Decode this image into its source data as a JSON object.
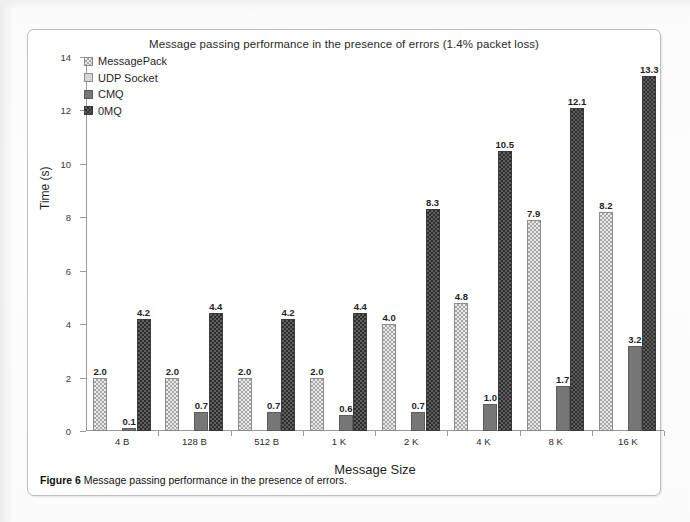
{
  "figure": {
    "caption_prefix": "Figure 6",
    "caption_text": "Message passing performance in the presence of errors."
  },
  "chart_data": {
    "type": "bar",
    "title": "Message passing performance in the presence of errors (1.4% packet loss)",
    "xlabel": "Message Size",
    "ylabel": "Time (s)",
    "ylim": [
      0,
      14
    ],
    "yticks": [
      0,
      2,
      4,
      6,
      8,
      10,
      12,
      14
    ],
    "grid": false,
    "legend_position": "top-left-inside",
    "categories": [
      "4 B",
      "128 B",
      "512 B",
      "1 K",
      "2 K",
      "4 K",
      "8 K",
      "16 K"
    ],
    "series": [
      {
        "name": "MessagePack",
        "fill": "checkered-light",
        "color": "#e9e9e9",
        "values": [
          2.0,
          2.0,
          2.0,
          2.0,
          4.0,
          4.8,
          7.9,
          8.2
        ],
        "labels": [
          "2.0",
          "2.0",
          "2.0",
          "2.0",
          "4.0",
          "4.8",
          "7.9",
          "8.2"
        ]
      },
      {
        "name": "UDP Socket",
        "fill": "solid-light-gray",
        "color": "#d6d6d6",
        "values": [
          0.0,
          0.0,
          0.0,
          0.0,
          0.0,
          0.0,
          0.0,
          0.0
        ],
        "labels": [
          "",
          "",
          "",
          "",
          "",
          "",
          "",
          ""
        ]
      },
      {
        "name": "CMQ",
        "fill": "solid-gray",
        "color": "#777777",
        "values": [
          0.1,
          0.7,
          0.7,
          0.6,
          0.7,
          1.0,
          1.7,
          3.2
        ],
        "labels": [
          "0.1",
          "0.7",
          "0.7",
          "0.6",
          "0.7",
          "1.0",
          "1.7",
          "3.2"
        ]
      },
      {
        "name": "0MQ",
        "fill": "checkered-dark",
        "color": "#5e5e5e",
        "values": [
          4.2,
          4.4,
          4.2,
          4.4,
          8.3,
          10.5,
          12.1,
          13.3
        ],
        "labels": [
          "4.2",
          "4.4",
          "4.2",
          "4.4",
          "8.3",
          "10.5",
          "12.1",
          "13.3"
        ]
      }
    ]
  }
}
